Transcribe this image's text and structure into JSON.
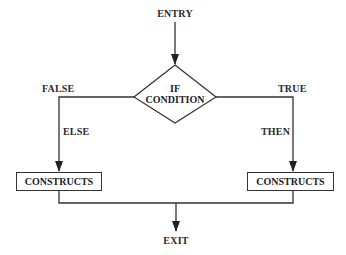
{
  "diagram": {
    "type": "flowchart",
    "nodes": {
      "entry": {
        "label": "ENTRY"
      },
      "condition": {
        "line1": "IF",
        "line2": "CONDITION"
      },
      "false_branch": {
        "label": "FALSE"
      },
      "true_branch": {
        "label": "TRUE"
      },
      "else_label": {
        "label": "ELSE"
      },
      "then_label": {
        "label": "THEN"
      },
      "else_constructs": {
        "label": "CONSTRUCTS"
      },
      "then_constructs": {
        "label": "CONSTRUCTS"
      },
      "exit": {
        "label": "EXIT"
      }
    },
    "edges": [
      {
        "from": "entry",
        "to": "condition"
      },
      {
        "from": "condition",
        "to": "else_constructs",
        "label": "FALSE / ELSE"
      },
      {
        "from": "condition",
        "to": "then_constructs",
        "label": "TRUE / THEN"
      },
      {
        "from": "else_constructs",
        "to": "exit"
      },
      {
        "from": "then_constructs",
        "to": "exit"
      }
    ],
    "colors": {
      "line": "#333333",
      "background": "#ffffff"
    }
  }
}
